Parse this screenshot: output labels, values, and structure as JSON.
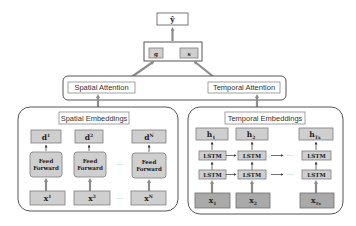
{
  "output": {
    "label": "ŷ"
  },
  "fusion": {
    "g_label": "g",
    "s_label": "s"
  },
  "attention": {
    "spatial_label": "Spatial Attention",
    "temporal_label": "Temporal Attention"
  },
  "spatial": {
    "title": "Spatial Embeddings",
    "outputs": [
      {
        "base": "d",
        "sup": "1"
      },
      {
        "base": "d",
        "sup": "2"
      },
      {
        "base": "d",
        "sup": "N"
      }
    ],
    "feedforward_line1": "Feed",
    "feedforward_line2": "Forward",
    "inputs": [
      {
        "base": "x",
        "sup": "1"
      },
      {
        "base": "x",
        "sup": "2"
      },
      {
        "base": "x",
        "sup": "N"
      }
    ],
    "ellipsis": "···"
  },
  "temporal": {
    "title": "Temporal Embeddings",
    "outputs": [
      {
        "base": "h",
        "sub": "1"
      },
      {
        "base": "h",
        "sub": "2"
      },
      {
        "base": "h",
        "sub": "Tx"
      }
    ],
    "lstm_label": "LSTM",
    "inputs": [
      {
        "base": "x",
        "sub": "1"
      },
      {
        "base": "x",
        "sub": "2"
      },
      {
        "base": "x",
        "sub": "Tx"
      }
    ],
    "ellipsis": "···"
  },
  "colors": {
    "box_fill": "#cfcfcf",
    "box_dark_fill": "#a9a9a9",
    "box_stroke": "#7d7d7d",
    "arrow": "#8c8c8c"
  }
}
